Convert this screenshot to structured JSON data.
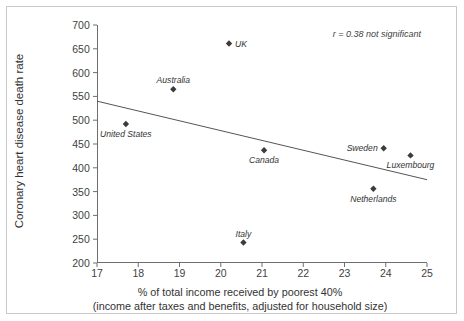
{
  "chart_data": {
    "type": "scatter",
    "title": "",
    "xlabel": "% of total income received by poorest 40%",
    "xlabel_line2": "(income after taxes and benefits, adjusted for household size)",
    "ylabel": "Coronary heart disease death rate",
    "xlim": [
      17,
      25
    ],
    "ylim": [
      200,
      700
    ],
    "xticks": [
      "17",
      "18",
      "19",
      "20",
      "21",
      "22",
      "23",
      "24",
      "25"
    ],
    "yticks": [
      "200",
      "250",
      "300",
      "350",
      "400",
      "450",
      "500",
      "550",
      "600",
      "650",
      "700"
    ],
    "grid": false,
    "legend": "none",
    "annotation": "r = 0.38 not significant",
    "marker": "diamond",
    "marker_color": "#3c3c3c",
    "line_color": "#555555",
    "axis_color": "#6e6e6e",
    "points": [
      {
        "label": "UK",
        "x": 20.2,
        "y": 661,
        "label_pos": "right"
      },
      {
        "label": "Australia",
        "x": 18.85,
        "y": 565,
        "label_pos": "above"
      },
      {
        "label": "United States",
        "x": 17.7,
        "y": 492,
        "label_pos": "below"
      },
      {
        "label": "Canada",
        "x": 21.05,
        "y": 437,
        "label_pos": "below"
      },
      {
        "label": "Sweden",
        "x": 23.95,
        "y": 441,
        "label_pos": "left"
      },
      {
        "label": "Luxembourg",
        "x": 24.6,
        "y": 426,
        "label_pos": "below"
      },
      {
        "label": "Netherlands",
        "x": 23.7,
        "y": 356,
        "label_pos": "below"
      },
      {
        "label": "Italy",
        "x": 20.55,
        "y": 243,
        "label_pos": "above"
      }
    ],
    "trendline": {
      "x0": 17,
      "y0": 540,
      "x1": 25,
      "y1": 375
    }
  }
}
